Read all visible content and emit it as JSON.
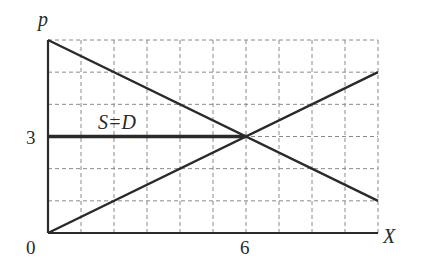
{
  "chart_data": {
    "type": "line",
    "title": "",
    "xlabel": "X",
    "ylabel": "p",
    "xlim": [
      0,
      10
    ],
    "ylim": [
      0,
      6
    ],
    "grid": true,
    "grid_style": "dashed",
    "tick_labels": {
      "x": [
        {
          "value": 0,
          "label": "0"
        },
        {
          "value": 6,
          "label": "6"
        }
      ],
      "y": [
        {
          "value": 3,
          "label": "3"
        }
      ]
    },
    "series": [
      {
        "name": "Demand",
        "points": [
          [
            0,
            6
          ],
          [
            10,
            1
          ]
        ]
      },
      {
        "name": "Supply",
        "points": [
          [
            0,
            0
          ],
          [
            10,
            5
          ]
        ]
      },
      {
        "name": "S=D",
        "points": [
          [
            0,
            3
          ],
          [
            6,
            3
          ]
        ]
      }
    ],
    "annotations": [
      {
        "text": "S=D",
        "x": 2.5,
        "y": 3.4
      }
    ],
    "equilibrium": {
      "x": 6,
      "y": 3
    }
  },
  "labels": {
    "y_axis": "p",
    "x_axis": "X",
    "origin": "0",
    "x_tick_6": "6",
    "y_tick_3": "3",
    "annotation": "S=D"
  },
  "colors": {
    "line": "#2a2a2a",
    "grid": "#8a8a8a",
    "background": "#ffffff"
  }
}
